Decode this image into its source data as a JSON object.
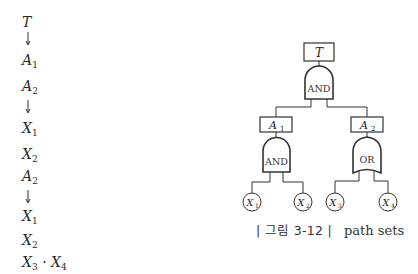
{
  "path_list": {
    "items": [
      {
        "kind": "text",
        "base": "T",
        "sub": ""
      },
      {
        "kind": "arrow"
      },
      {
        "kind": "text",
        "base": "A",
        "sub": "1"
      },
      {
        "kind": "text",
        "base": "A",
        "sub": "2"
      },
      {
        "kind": "arrow"
      },
      {
        "kind": "text",
        "base": "X",
        "sub": "1"
      },
      {
        "kind": "text",
        "base": "X",
        "sub": "2"
      },
      {
        "kind": "text",
        "base": "A",
        "sub": "2"
      },
      {
        "kind": "arrow"
      },
      {
        "kind": "text",
        "base": "X",
        "sub": "1"
      },
      {
        "kind": "text",
        "base": "X",
        "sub": "2"
      },
      {
        "kind": "product",
        "a_base": "X",
        "a_sub": "3",
        "sep": "·",
        "b_base": "X",
        "b_sub": "4"
      }
    ]
  },
  "fault_tree": {
    "top_event": {
      "base": "T",
      "sub": ""
    },
    "top_gate": {
      "type": "AND",
      "label": "AND"
    },
    "intermediate": [
      {
        "base": "A",
        "sub": "1",
        "gate": {
          "type": "AND",
          "label": "AND"
        }
      },
      {
        "base": "A",
        "sub": "2",
        "gate": {
          "type": "OR",
          "label": "OR"
        }
      }
    ],
    "basic_events": [
      {
        "base": "X",
        "sub": "1"
      },
      {
        "base": "X",
        "sub": "2"
      },
      {
        "base": "X",
        "sub": "3"
      },
      {
        "base": "X",
        "sub": "4"
      }
    ]
  },
  "caption": {
    "figure_number": "| 그림 3-12 |",
    "title": "path sets"
  }
}
